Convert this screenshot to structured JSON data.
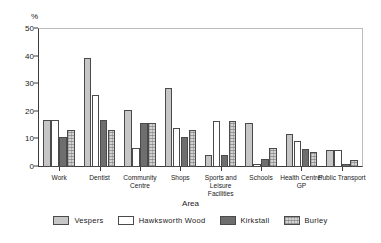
{
  "chart_data": {
    "type": "bar",
    "title": "",
    "xlabel": "Area",
    "ylabel": "%",
    "ylim": [
      0,
      50
    ],
    "yticks": [
      0,
      10,
      20,
      30,
      40,
      50
    ],
    "grid": false,
    "legend_position": "bottom",
    "categories": [
      "Work",
      "Dentist",
      "Community Centre",
      "Shops",
      "Sports and Leisure Facilities",
      "Schools",
      "Health Centre/ GP",
      "Public Transport"
    ],
    "series": [
      {
        "name": "Vespers",
        "color": "#c6c6c6",
        "values": [
          17.0,
          39.5,
          20.5,
          28.5,
          4.5,
          16.0,
          12.0,
          6.0
        ]
      },
      {
        "name": "Hawksworth Wood",
        "color": "#ffffff",
        "values": [
          17.0,
          26.0,
          7.0,
          14.0,
          16.5,
          1.0,
          9.5,
          6.0
        ]
      },
      {
        "name": "Kirkstall",
        "color": "#6e6e6e",
        "values": [
          11.0,
          17.0,
          16.0,
          11.0,
          4.5,
          3.0,
          6.5,
          1.0
        ]
      },
      {
        "name": "Burley",
        "color": "#d2d2d2",
        "values": [
          13.5,
          13.5,
          16.0,
          13.5,
          16.5,
          7.0,
          5.5,
          2.5
        ]
      }
    ]
  },
  "legend": {
    "items": [
      {
        "label": "Vespers"
      },
      {
        "label": "Hawksworth Wood"
      },
      {
        "label": "Kirkstall"
      },
      {
        "label": "Burley"
      }
    ]
  }
}
